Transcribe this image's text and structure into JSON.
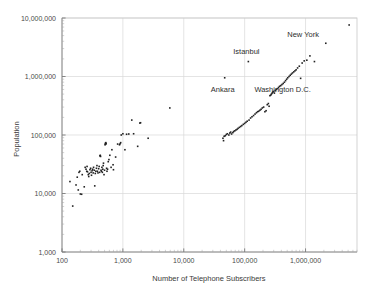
{
  "chart_data": {
    "type": "scatter",
    "title": "",
    "xlabel": "Number of Telephone Subscribers",
    "ylabel": "Population",
    "xscale": "log",
    "yscale": "log",
    "xlim": [
      100,
      7000000
    ],
    "ylim": [
      1000,
      10000000
    ],
    "grid": true,
    "legend": "none",
    "xticks": [
      100,
      1000,
      10000,
      100000,
      1000000
    ],
    "xtick_labels": [
      "100",
      "1,000",
      "10,000",
      "100,000",
      "1,000,000"
    ],
    "yticks": [
      1000,
      10000,
      100000,
      1000000,
      10000000
    ],
    "ytick_labels": [
      "1,000",
      "10,000",
      "100,000",
      "1,000,000",
      "10,000,000"
    ],
    "marker": {
      "shape": "square",
      "size_px": 1.6,
      "color": "#222222"
    },
    "annotations": [
      {
        "text": "New York",
        "x": 5200000,
        "y": 7600000,
        "dx": -46,
        "dy": 12
      },
      {
        "text": "Istanbul",
        "x": 115000,
        "y": 1800000,
        "dx": -2,
        "dy": -8
      },
      {
        "text": "Ankara",
        "x": 47000,
        "y": 950000,
        "dx": -2,
        "dy": 14
      },
      {
        "text": "Washington D.C.",
        "x": 830000,
        "y": 930000,
        "dx": -18,
        "dy": 14
      }
    ],
    "points": [
      [
        135,
        16000
      ],
      [
        150,
        6100
      ],
      [
        170,
        14000
      ],
      [
        178,
        19000
      ],
      [
        185,
        11500
      ],
      [
        190,
        23000
      ],
      [
        196,
        24000
      ],
      [
        200,
        9800
      ],
      [
        210,
        9700
      ],
      [
        215,
        21000
      ],
      [
        232,
        13000
      ],
      [
        240,
        28000
      ],
      [
        248,
        26000
      ],
      [
        255,
        24000
      ],
      [
        258,
        29000
      ],
      [
        262,
        23500
      ],
      [
        270,
        21000
      ],
      [
        275,
        19500
      ],
      [
        280,
        22000
      ],
      [
        288,
        25500
      ],
      [
        295,
        27000
      ],
      [
        300,
        23000
      ],
      [
        305,
        20500
      ],
      [
        312,
        24500
      ],
      [
        318,
        26000
      ],
      [
        325,
        22500
      ],
      [
        330,
        28000
      ],
      [
        338,
        25000
      ],
      [
        345,
        13500
      ],
      [
        352,
        22000
      ],
      [
        360,
        24000
      ],
      [
        368,
        27000
      ],
      [
        375,
        30000
      ],
      [
        382,
        24000
      ],
      [
        390,
        22500
      ],
      [
        400,
        26500
      ],
      [
        408,
        29000
      ],
      [
        415,
        23000
      ],
      [
        420,
        44000
      ],
      [
        425,
        45000
      ],
      [
        430,
        43000
      ],
      [
        438,
        25000
      ],
      [
        445,
        24000
      ],
      [
        452,
        28000
      ],
      [
        460,
        23000
      ],
      [
        468,
        26000
      ],
      [
        475,
        30000
      ],
      [
        480,
        33000
      ],
      [
        490,
        21000
      ],
      [
        500,
        25000
      ],
      [
        510,
        68000
      ],
      [
        515,
        72000
      ],
      [
        520,
        70000
      ],
      [
        525,
        74000
      ],
      [
        530,
        71000
      ],
      [
        540,
        27000
      ],
      [
        548,
        24000
      ],
      [
        560,
        26000
      ],
      [
        575,
        35000
      ],
      [
        590,
        38000
      ],
      [
        610,
        45000
      ],
      [
        640,
        28000
      ],
      [
        660,
        56000
      ],
      [
        690,
        31000
      ],
      [
        700,
        25500
      ],
      [
        760,
        42000
      ],
      [
        820,
        70000
      ],
      [
        880,
        68000
      ],
      [
        900,
        71000
      ],
      [
        920,
        74000
      ],
      [
        940,
        100000
      ],
      [
        1000,
        105000
      ],
      [
        1080,
        56000
      ],
      [
        1150,
        103000
      ],
      [
        1250,
        104000
      ],
      [
        1400,
        180000
      ],
      [
        1500,
        105000
      ],
      [
        1750,
        64000
      ],
      [
        1900,
        160000
      ],
      [
        1950,
        162000
      ],
      [
        2600,
        88000
      ],
      [
        5900,
        290000
      ],
      [
        44000,
        88000
      ],
      [
        45000,
        80000
      ],
      [
        46000,
        95000
      ],
      [
        47000,
        950000
      ],
      [
        48000,
        97000
      ],
      [
        50000,
        102000
      ],
      [
        52000,
        105000
      ],
      [
        55000,
        100000
      ],
      [
        57000,
        108000
      ],
      [
        59000,
        112000
      ],
      [
        61000,
        104000
      ],
      [
        64000,
        110000
      ],
      [
        66000,
        115000
      ],
      [
        69000,
        118000
      ],
      [
        72000,
        122000
      ],
      [
        75000,
        125000
      ],
      [
        78000,
        130000
      ],
      [
        82000,
        135000
      ],
      [
        86000,
        140000
      ],
      [
        90000,
        145000
      ],
      [
        95000,
        152000
      ],
      [
        100000,
        158000
      ],
      [
        105000,
        165000
      ],
      [
        110000,
        172000
      ],
      [
        115000,
        1800000
      ],
      [
        118000,
        180000
      ],
      [
        125000,
        195000
      ],
      [
        132000,
        205000
      ],
      [
        140000,
        215000
      ],
      [
        148000,
        228000
      ],
      [
        156000,
        240000
      ],
      [
        163000,
        250000
      ],
      [
        170000,
        255000
      ],
      [
        178000,
        265000
      ],
      [
        186000,
        275000
      ],
      [
        195000,
        290000
      ],
      [
        205000,
        300000
      ],
      [
        215000,
        250000
      ],
      [
        225000,
        260000
      ],
      [
        235000,
        330000
      ],
      [
        245000,
        345000
      ],
      [
        252000,
        310000
      ],
      [
        260000,
        470000
      ],
      [
        268000,
        480000
      ],
      [
        275000,
        500000
      ],
      [
        282000,
        520000
      ],
      [
        290000,
        540000
      ],
      [
        298000,
        555000
      ],
      [
        308000,
        520000
      ],
      [
        318000,
        575000
      ],
      [
        330000,
        600000
      ],
      [
        345000,
        620000
      ],
      [
        360000,
        650000
      ],
      [
        375000,
        680000
      ],
      [
        392000,
        700000
      ],
      [
        410000,
        730000
      ],
      [
        430000,
        760000
      ],
      [
        450000,
        800000
      ],
      [
        470000,
        850000
      ],
      [
        490000,
        900000
      ],
      [
        510000,
        950000
      ],
      [
        535000,
        1000000
      ],
      [
        560000,
        1050000
      ],
      [
        585000,
        1100000
      ],
      [
        610000,
        1150000
      ],
      [
        640000,
        1200000
      ],
      [
        670000,
        1250000
      ],
      [
        700000,
        1300000
      ],
      [
        740000,
        1400000
      ],
      [
        790000,
        1500000
      ],
      [
        830000,
        930000
      ],
      [
        880000,
        1700000
      ],
      [
        950000,
        1850000
      ],
      [
        1050000,
        1900000
      ],
      [
        1180000,
        2250000
      ],
      [
        1400000,
        1800000
      ],
      [
        2150000,
        3700000
      ],
      [
        5200000,
        7600000
      ]
    ]
  }
}
